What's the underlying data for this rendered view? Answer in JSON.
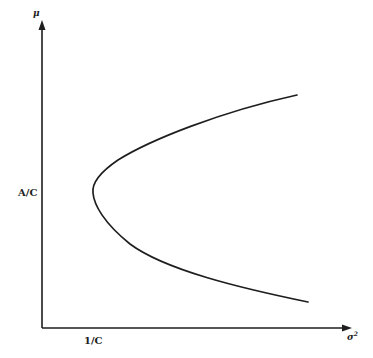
{
  "diagram": {
    "title": "",
    "y_axis": {
      "label": "μ"
    },
    "x_axis": {
      "label": "σ",
      "label_superscript": "2"
    },
    "annotations": {
      "y_tick": "A/C",
      "x_tick": "1/C"
    },
    "curve": {
      "type": "parabola",
      "vertex": {
        "x_label": "1/C",
        "y_label": "A/C"
      },
      "opens": "right"
    },
    "colors": {
      "ink": "#1e1e1e",
      "background": "#ffffff"
    }
  }
}
